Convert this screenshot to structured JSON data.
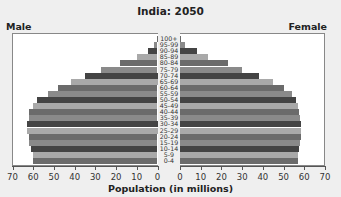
{
  "chart_data": {
    "type": "bar",
    "subtype": "population-pyramid",
    "title": "India: 2050",
    "xlabel": "Population (in millions)",
    "left_label": "Male",
    "right_label": "Female",
    "xlim": [
      0,
      70
    ],
    "x_ticks": [
      70,
      60,
      50,
      40,
      30,
      20,
      10,
      0
    ],
    "right_x_ticks": [
      0,
      10,
      20,
      30,
      40,
      50,
      60,
      70
    ],
    "categories": [
      "100+",
      "95-99",
      "90-94",
      "85-89",
      "80-84",
      "75-79",
      "70-74",
      "65-69",
      "60-64",
      "55-59",
      "50-54",
      "45-49",
      "40-44",
      "35-39",
      "30-34",
      "25-29",
      "20-24",
      "15-19",
      "10-14",
      "5-9",
      "0-4"
    ],
    "series": [
      {
        "name": "Male",
        "values": [
          0.3,
          1.5,
          4.5,
          10,
          18,
          27.5,
          35,
          42,
          48,
          53,
          58,
          60,
          62,
          62,
          63,
          63,
          62,
          62,
          61,
          60,
          60
        ]
      },
      {
        "name": "Female",
        "values": [
          0.5,
          2.5,
          8,
          13.5,
          23,
          30,
          38,
          45,
          50,
          54,
          56,
          57,
          57.5,
          58,
          58.5,
          58.5,
          58.5,
          58,
          57.5,
          57,
          57
        ]
      }
    ],
    "grid": false,
    "legend": "none"
  },
  "colors": {
    "background": "#efefef",
    "panel": "#ffffff",
    "shades": [
      "#6b6b6b",
      "#8a8a8a",
      "#444444",
      "#a9a9a9"
    ]
  }
}
